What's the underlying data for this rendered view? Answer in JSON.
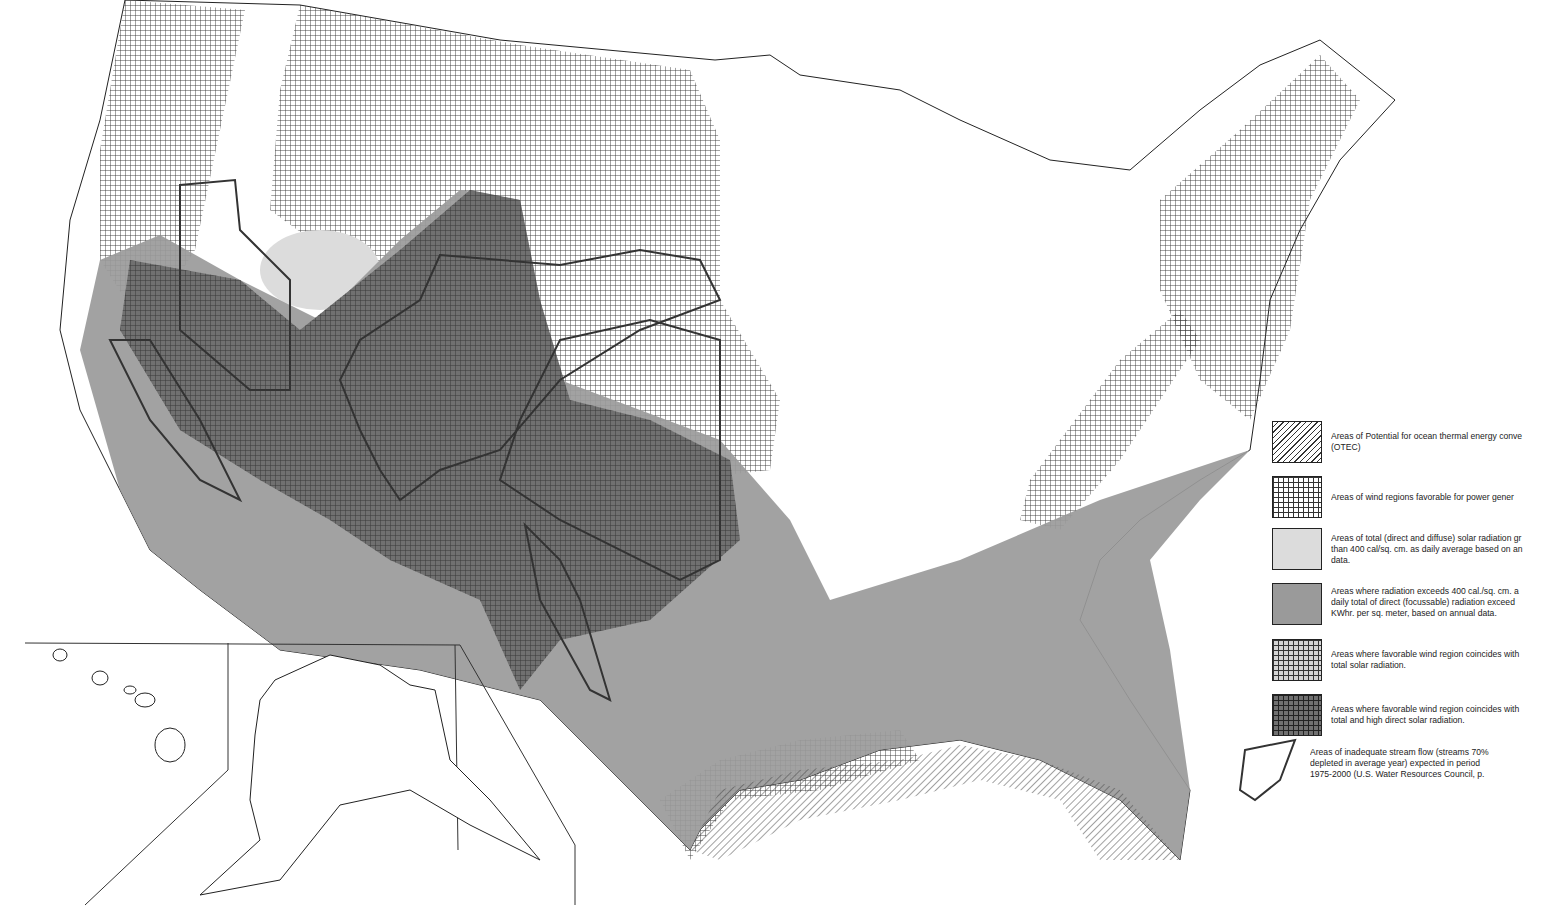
{
  "map": {
    "subject": "Renewable energy resources of the United States",
    "regions_shown": [
      "Contiguous United States",
      "Alaska inset",
      "Hawaii inset"
    ],
    "colors": {
      "background": "#ffffff",
      "outline": "#222222",
      "total_solar": "#dcdcdc",
      "direct_solar": "#9a9a9a",
      "wind_direct_solar": "#707070",
      "hatch": "#333333"
    }
  },
  "legend": {
    "items": [
      {
        "id": "otec",
        "swatch": "diagonal-hatch",
        "lines": [
          "Areas of Potential for ocean thermal energy conve",
          "(OTEC)"
        ]
      },
      {
        "id": "wind",
        "swatch": "grid-hatch",
        "lines": [
          "Areas of wind regions favorable for power gener"
        ]
      },
      {
        "id": "total-solar",
        "swatch": "light-gray",
        "lines": [
          "Areas of total (direct and diffuse) solar radiation gr",
          "than 400 cal/sq. cm. as daily average based on an",
          "data."
        ]
      },
      {
        "id": "direct-solar",
        "swatch": "medium-gray",
        "lines": [
          "Areas where radiation exceeds 400 cal./sq. cm. a",
          "daily total of direct (focussable) radiation exceed",
          "KWhr. per sq. meter, based on annual data."
        ]
      },
      {
        "id": "wind-total",
        "swatch": "grid-on-light-gray",
        "lines": [
          "Areas where favorable wind region coincides with",
          "total solar radiation."
        ]
      },
      {
        "id": "wind-direct",
        "swatch": "grid-on-dark-gray",
        "lines": [
          "Areas where favorable wind region coincides with",
          "total and high direct solar radiation."
        ]
      },
      {
        "id": "streamflow",
        "swatch": "outline-loop",
        "lines": [
          "Areas of inadequate stream flow (streams 70%",
          "depleted in average year) expected in period",
          "1975-2000 (U.S. Water Resources Council, p."
        ]
      }
    ]
  }
}
